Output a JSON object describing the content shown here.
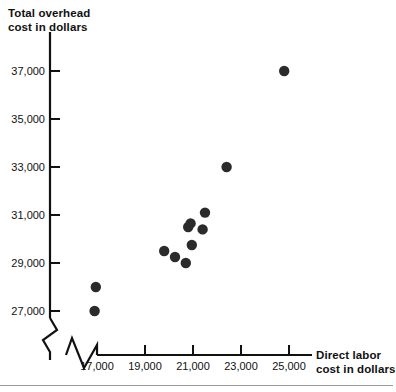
{
  "chart_data": {
    "type": "scatter",
    "title": "",
    "xlabel": "Direct labor cost in dollars",
    "ylabel": "Total overhead cost in dollars",
    "xlim": [
      16000,
      26000
    ],
    "ylim": [
      26500,
      37800
    ],
    "x_ticks": [
      17000,
      19000,
      21000,
      23000,
      25000
    ],
    "y_ticks": [
      27000,
      29000,
      31000,
      33000,
      35000,
      37000
    ],
    "x_tick_labels": [
      "17,000",
      "19,000",
      "21,000",
      "23,000",
      "25,000"
    ],
    "y_tick_labels": [
      "27,000",
      "29,000",
      "31,000",
      "33,000",
      "35,000",
      "37,000"
    ],
    "grid": false,
    "legend": "none",
    "axis_break_x": true,
    "axis_break_y": true,
    "points": [
      {
        "x": 16950,
        "y": 28000
      },
      {
        "x": 16900,
        "y": 27000
      },
      {
        "x": 19800,
        "y": 29500
      },
      {
        "x": 20250,
        "y": 29250
      },
      {
        "x": 20700,
        "y": 29000
      },
      {
        "x": 20950,
        "y": 29750
      },
      {
        "x": 20800,
        "y": 30500
      },
      {
        "x": 21400,
        "y": 30400
      },
      {
        "x": 20900,
        "y": 30650
      },
      {
        "x": 21500,
        "y": 31100
      },
      {
        "x": 22400,
        "y": 33000
      },
      {
        "x": 24800,
        "y": 37000
      }
    ]
  },
  "axis_titles": {
    "y": "Total overhead\ncost in dollars",
    "x": "Direct labor\ncost in dollars"
  },
  "colors": {
    "point": "#2b2b2b",
    "axis": "#111111",
    "text": "#111111"
  }
}
